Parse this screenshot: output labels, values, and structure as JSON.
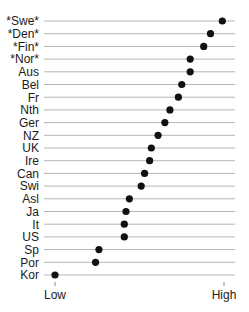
{
  "chart_data": {
    "type": "scatter",
    "subtype": "dot-plot",
    "title": "",
    "xlabel": "",
    "ylabel": "",
    "x_tick_labels": [
      "Low",
      "High"
    ],
    "xlim": [
      0,
      100
    ],
    "grid": "horizontal guide lines per category",
    "legend": "none",
    "categories": [
      "*Swe*",
      "*Den*",
      "*Fin*",
      "*Nor*",
      "Aus",
      "Bel",
      "Fr",
      "Nth",
      "Ger",
      "NZ",
      "UK",
      "Ire",
      "Can",
      "Swi",
      "Asl",
      "Ja",
      "It",
      "US",
      "Sp",
      "Por",
      "Kor"
    ],
    "values": [
      99,
      92,
      88,
      80,
      80,
      75,
      73,
      68,
      65,
      61,
      57,
      56,
      53,
      51,
      44,
      42,
      41,
      41,
      26,
      24,
      0
    ]
  },
  "colors": {
    "dot": "#111111",
    "guide_line": "#b5b5b5",
    "text": "#1a1a1a"
  }
}
